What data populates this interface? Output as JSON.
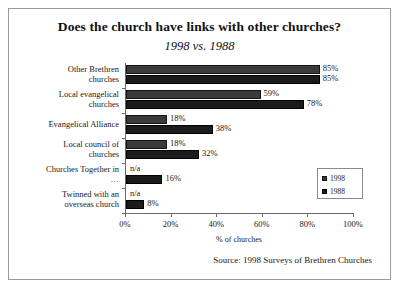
{
  "chart_data": {
    "type": "bar",
    "orientation": "horizontal",
    "title": "Does the church have links with other churches?",
    "subtitle": "1998 vs. 1988",
    "xlabel": "% of churches",
    "ylabel": "",
    "xlim": [
      0,
      100
    ],
    "xticks": [
      "0%",
      "20%",
      "40%",
      "60%",
      "80%",
      "100%"
    ],
    "xtick_values": [
      0,
      20,
      40,
      60,
      80,
      100
    ],
    "grid": false,
    "legend_position": "right-inside",
    "categories": [
      "Other Brethren churches",
      "Local evangelical churches",
      "Evangelical Alliance",
      "Local council of churches",
      "Churches Together in …",
      "Twinned with an overseas church"
    ],
    "category_lines": [
      [
        "Other Brethren",
        "churches"
      ],
      [
        "Local evangelical",
        "churches"
      ],
      [
        "Evangelical Alliance"
      ],
      [
        "Local council of",
        "churches"
      ],
      [
        "Churches Together in",
        "…"
      ],
      [
        "Twinned with an",
        "overseas church"
      ]
    ],
    "series": [
      {
        "name": "1998",
        "color": "#3a3a3a",
        "values": [
          85,
          59,
          18,
          18,
          null,
          null
        ],
        "labels": [
          "85%",
          "59%",
          "18%",
          "18%",
          "n/a",
          "n/a"
        ]
      },
      {
        "name": "1988",
        "color": "#1b1b1b",
        "values": [
          85,
          78,
          38,
          32,
          16,
          8
        ],
        "labels": [
          "85%",
          "78%",
          "38%",
          "32%",
          "16%",
          "8%"
        ]
      }
    ],
    "source": "Source: 1998 Surveys of Brethren Churches"
  },
  "legend": {
    "entries": [
      {
        "label": "1998"
      },
      {
        "label": "1988"
      }
    ]
  }
}
